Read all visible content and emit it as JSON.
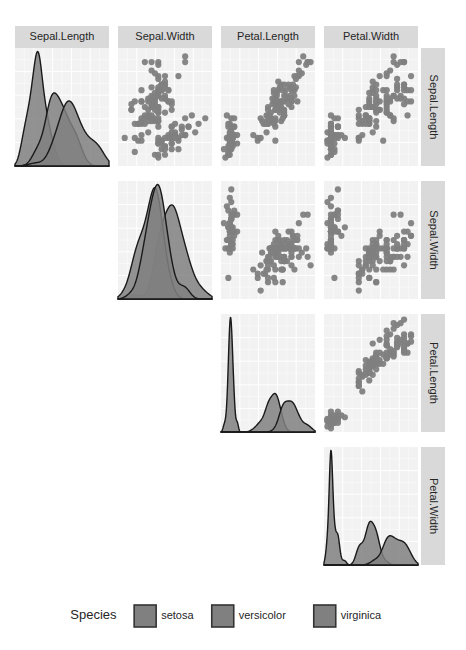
{
  "chart_data": {
    "type": "scatter",
    "title": "",
    "subtitle": "",
    "plot_kind": "scatterplot-matrix",
    "matrix_shape": "upper-triangle",
    "variables": [
      "Sepal.Length",
      "Sepal.Width",
      "Petal.Length",
      "Petal.Width"
    ],
    "column_headers": [
      "Sepal.Length",
      "Sepal.Width",
      "Petal.Length",
      "Petal.Width"
    ],
    "row_headers": [
      "Sepal.Length",
      "Sepal.Width",
      "Petal.Length",
      "Petal.Width"
    ],
    "xlabel": "",
    "ylabel": "",
    "grid": true,
    "panel_background": "#f2f2f2",
    "gridline_color": "#ffffff",
    "point_color": "#808080",
    "density_fill": "#808080",
    "density_line": "#1a1a1a",
    "strip_background": "#d9d9d9",
    "strip_text_color": "#262626",
    "diagonal_type": "density",
    "offdiagonal_type": "scatter",
    "axis_ranges": {
      "Sepal.Length": [
        4.0,
        8.2
      ],
      "Sepal.Width": [
        1.8,
        4.6
      ],
      "Petal.Length": [
        0.8,
        7.2
      ],
      "Petal.Width": [
        0.0,
        2.7
      ]
    },
    "legend": {
      "title": "Species",
      "position": "bottom",
      "entries": [
        {
          "label": "setosa",
          "color": "#808080"
        },
        {
          "label": "versicolor",
          "color": "#808080"
        },
        {
          "label": "virginica",
          "color": "#808080"
        }
      ]
    },
    "series": [
      {
        "name": "setosa",
        "color": "#808080",
        "n": 50,
        "Sepal.Length": [
          5.1,
          4.9,
          4.7,
          4.6,
          5.0,
          5.4,
          4.6,
          5.0,
          4.4,
          4.9,
          5.4,
          4.8,
          4.8,
          4.3,
          5.8,
          5.7,
          5.4,
          5.1,
          5.7,
          5.1,
          5.4,
          5.1,
          4.6,
          5.1,
          4.8,
          5.0,
          5.0,
          5.2,
          5.2,
          4.7,
          4.8,
          5.4,
          5.2,
          5.5,
          4.9,
          5.0,
          5.5,
          4.9,
          4.4,
          5.1,
          5.0,
          4.5,
          4.4,
          5.0,
          5.1,
          4.8,
          5.1,
          4.6,
          5.3,
          5.0
        ],
        "Sepal.Width": [
          3.5,
          3.0,
          3.2,
          3.1,
          3.6,
          3.9,
          3.4,
          3.4,
          2.9,
          3.1,
          3.7,
          3.4,
          3.0,
          3.0,
          4.0,
          4.4,
          3.9,
          3.5,
          3.8,
          3.8,
          3.4,
          3.7,
          3.6,
          3.3,
          3.4,
          3.0,
          3.4,
          3.5,
          3.4,
          3.2,
          3.1,
          3.4,
          4.1,
          4.2,
          3.1,
          3.2,
          3.5,
          3.6,
          3.0,
          3.4,
          3.5,
          2.3,
          3.2,
          3.5,
          3.8,
          3.0,
          3.8,
          3.2,
          3.7,
          3.3
        ],
        "Petal.Length": [
          1.4,
          1.4,
          1.3,
          1.5,
          1.4,
          1.7,
          1.4,
          1.5,
          1.4,
          1.5,
          1.5,
          1.6,
          1.4,
          1.1,
          1.2,
          1.5,
          1.3,
          1.4,
          1.7,
          1.5,
          1.7,
          1.5,
          1.0,
          1.7,
          1.9,
          1.6,
          1.6,
          1.5,
          1.4,
          1.6,
          1.6,
          1.5,
          1.5,
          1.4,
          1.5,
          1.2,
          1.3,
          1.4,
          1.3,
          1.5,
          1.3,
          1.3,
          1.3,
          1.6,
          1.9,
          1.4,
          1.6,
          1.4,
          1.5,
          1.4
        ],
        "Petal.Width": [
          0.2,
          0.2,
          0.2,
          0.2,
          0.2,
          0.4,
          0.3,
          0.2,
          0.2,
          0.1,
          0.2,
          0.2,
          0.1,
          0.1,
          0.2,
          0.4,
          0.4,
          0.3,
          0.3,
          0.3,
          0.2,
          0.4,
          0.2,
          0.5,
          0.2,
          0.2,
          0.4,
          0.2,
          0.2,
          0.2,
          0.2,
          0.4,
          0.1,
          0.2,
          0.2,
          0.2,
          0.2,
          0.1,
          0.2,
          0.2,
          0.3,
          0.3,
          0.2,
          0.6,
          0.4,
          0.3,
          0.2,
          0.2,
          0.2,
          0.2
        ]
      },
      {
        "name": "versicolor",
        "color": "#808080",
        "n": 50,
        "Sepal.Length": [
          7.0,
          6.4,
          6.9,
          5.5,
          6.5,
          5.7,
          6.3,
          4.9,
          6.6,
          5.2,
          5.0,
          5.9,
          6.0,
          6.1,
          5.6,
          6.7,
          5.6,
          5.8,
          6.2,
          5.6,
          5.9,
          6.1,
          6.3,
          6.1,
          6.4,
          6.6,
          6.8,
          6.7,
          6.0,
          5.7,
          5.5,
          5.5,
          5.8,
          6.0,
          5.4,
          6.0,
          6.7,
          6.3,
          5.6,
          5.5,
          5.5,
          6.1,
          5.8,
          5.0,
          5.6,
          5.7,
          5.7,
          6.2,
          5.1,
          5.7
        ],
        "Sepal.Width": [
          3.2,
          3.2,
          3.1,
          2.3,
          2.8,
          2.8,
          3.3,
          2.4,
          2.9,
          2.7,
          2.0,
          3.0,
          2.2,
          2.9,
          2.9,
          3.1,
          3.0,
          2.7,
          2.2,
          2.5,
          3.2,
          2.8,
          2.5,
          2.8,
          2.9,
          3.0,
          2.8,
          3.0,
          2.9,
          2.6,
          2.4,
          2.4,
          2.7,
          2.7,
          3.0,
          3.4,
          3.1,
          2.3,
          3.0,
          2.5,
          2.6,
          3.0,
          2.6,
          2.3,
          2.7,
          3.0,
          2.9,
          2.9,
          2.5,
          2.8
        ],
        "Petal.Length": [
          4.7,
          4.5,
          4.9,
          4.0,
          4.6,
          4.5,
          4.7,
          3.3,
          4.6,
          3.9,
          3.5,
          4.2,
          4.0,
          4.7,
          3.6,
          4.4,
          4.5,
          4.1,
          4.5,
          3.9,
          4.8,
          4.0,
          4.9,
          4.7,
          4.3,
          4.4,
          4.8,
          5.0,
          4.5,
          3.5,
          3.8,
          3.7,
          3.9,
          5.1,
          4.5,
          4.5,
          4.7,
          4.4,
          4.1,
          4.0,
          4.4,
          4.6,
          4.0,
          3.3,
          4.2,
          4.2,
          4.2,
          4.3,
          3.0,
          4.1
        ],
        "Petal.Width": [
          1.4,
          1.5,
          1.5,
          1.3,
          1.5,
          1.3,
          1.6,
          1.0,
          1.3,
          1.4,
          1.0,
          1.5,
          1.0,
          1.4,
          1.3,
          1.4,
          1.5,
          1.0,
          1.5,
          1.1,
          1.8,
          1.3,
          1.5,
          1.2,
          1.3,
          1.4,
          1.4,
          1.7,
          1.5,
          1.0,
          1.1,
          1.0,
          1.2,
          1.6,
          1.5,
          1.6,
          1.5,
          1.3,
          1.3,
          1.3,
          1.2,
          1.4,
          1.2,
          1.0,
          1.3,
          1.2,
          1.3,
          1.3,
          1.1,
          1.3
        ]
      },
      {
        "name": "virginica",
        "color": "#808080",
        "n": 50,
        "Sepal.Length": [
          6.3,
          5.8,
          7.1,
          6.3,
          6.5,
          7.6,
          4.9,
          7.3,
          6.7,
          7.2,
          6.5,
          6.4,
          6.8,
          5.7,
          5.8,
          6.4,
          6.5,
          7.7,
          7.7,
          6.0,
          6.9,
          5.6,
          7.7,
          6.3,
          6.7,
          7.2,
          6.2,
          6.1,
          6.4,
          7.2,
          7.4,
          7.9,
          6.4,
          6.3,
          6.1,
          7.7,
          6.3,
          6.4,
          6.0,
          6.9,
          6.7,
          6.9,
          5.8,
          6.8,
          6.7,
          6.7,
          6.3,
          6.5,
          6.2,
          5.9
        ],
        "Sepal.Width": [
          3.3,
          2.7,
          3.0,
          2.9,
          3.0,
          3.0,
          2.5,
          2.9,
          2.5,
          3.6,
          3.2,
          2.7,
          3.0,
          2.5,
          2.8,
          3.2,
          3.0,
          3.8,
          2.6,
          2.2,
          3.2,
          2.8,
          2.8,
          2.7,
          3.3,
          3.2,
          2.8,
          3.0,
          2.8,
          3.0,
          2.8,
          3.8,
          2.8,
          2.8,
          2.6,
          3.0,
          3.4,
          3.1,
          3.0,
          3.1,
          3.1,
          3.1,
          2.7,
          3.2,
          3.3,
          3.0,
          2.5,
          3.0,
          3.4,
          3.0
        ],
        "Petal.Length": [
          6.0,
          5.1,
          5.9,
          5.6,
          5.8,
          6.6,
          4.5,
          6.3,
          5.8,
          6.1,
          5.1,
          5.3,
          5.5,
          5.0,
          5.1,
          5.3,
          5.5,
          6.7,
          6.9,
          5.0,
          5.7,
          4.9,
          6.7,
          4.9,
          5.7,
          6.0,
          4.8,
          4.9,
          5.6,
          5.8,
          6.1,
          6.4,
          5.6,
          5.1,
          5.6,
          6.1,
          5.6,
          5.5,
          4.8,
          5.4,
          5.6,
          5.1,
          5.1,
          5.9,
          5.7,
          5.2,
          5.0,
          5.2,
          5.4,
          5.1
        ],
        "Petal.Width": [
          2.5,
          1.9,
          2.1,
          1.8,
          2.2,
          2.1,
          1.7,
          1.8,
          1.8,
          2.5,
          2.0,
          1.9,
          2.1,
          2.0,
          2.4,
          2.3,
          1.8,
          2.2,
          2.3,
          1.5,
          2.3,
          2.0,
          2.0,
          1.8,
          2.1,
          1.8,
          1.8,
          1.8,
          2.1,
          1.6,
          1.9,
          2.0,
          2.2,
          1.5,
          1.4,
          2.3,
          2.4,
          1.8,
          1.8,
          2.1,
          2.4,
          2.3,
          1.9,
          2.3,
          2.5,
          2.3,
          1.9,
          2.0,
          2.3,
          1.8
        ]
      }
    ]
  },
  "legend": {
    "title": "Species",
    "items": [
      {
        "label": "setosa"
      },
      {
        "label": "versicolor"
      },
      {
        "label": "virginica"
      }
    ]
  },
  "strips": {
    "top": [
      "Sepal.Length",
      "Sepal.Width",
      "Petal.Length",
      "Petal.Width"
    ],
    "right": [
      "Sepal.Length",
      "Sepal.Width",
      "Petal.Length",
      "Petal.Width"
    ]
  }
}
